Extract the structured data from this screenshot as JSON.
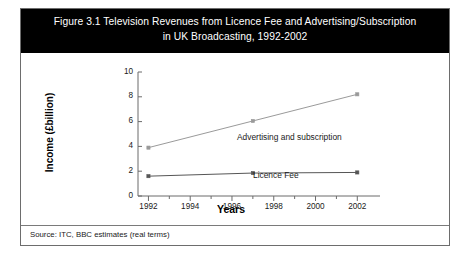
{
  "figure": {
    "title_line1": "Figure 3.1 Television Revenues from Licence Fee and Advertising/Subscription",
    "title_line2": "in UK Broadcasting, 1992-2002",
    "source_note": "Source: ITC, BBC estimates (real terms)"
  },
  "colors": {
    "banner_background": "#000000",
    "banner_text": "#ffffff",
    "frame_border": "#6d6d6d",
    "axis": "#6b6b6b",
    "advertising_series": "#9a9a9a",
    "licence_series": "#565656",
    "page_background": "#ffffff"
  },
  "chart_data": {
    "type": "line",
    "title": "Figure 3.1 Television Revenues from Licence Fee and Advertising/Subscription in UK Broadcasting, 1992-2002",
    "xlabel": "Years",
    "ylabel": "Income (£billion)",
    "xlim": [
      1991.5,
      2002.8
    ],
    "ylim": [
      0,
      10
    ],
    "grid": false,
    "legend": "inline-labels",
    "x": [
      1992,
      1997,
      2002
    ],
    "xticks": [
      1992,
      1994,
      1996,
      1998,
      2000,
      2002
    ],
    "xtick_labels": [
      "1992",
      "1994",
      "1996",
      "1998",
      "2000",
      "2002"
    ],
    "xminor_ticks": [
      1993,
      1995,
      1997,
      1999,
      2001
    ],
    "yticks": [
      0,
      2,
      4,
      6,
      8,
      10
    ],
    "ytick_labels": [
      "0",
      "2",
      "4",
      "6",
      "8",
      "10"
    ],
    "series": [
      {
        "name": "Advertising and subscription",
        "values": [
          3.9,
          6.05,
          8.2
        ],
        "color": "#9a9a9a",
        "marker": "square",
        "label_text": "Advertising and subscription"
      },
      {
        "name": "Licence Fee",
        "values": [
          1.6,
          1.85,
          1.9
        ],
        "color": "#565656",
        "marker": "square",
        "label_text": "Licence Fee"
      }
    ]
  }
}
